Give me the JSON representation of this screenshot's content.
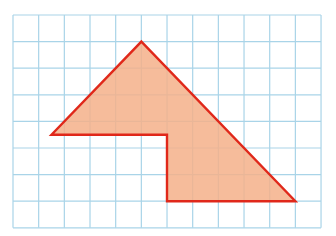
{
  "figure": {
    "type": "grid-polygon",
    "grid": {
      "columns": 12,
      "rows": 8,
      "origin_px": [
        13,
        15
      ],
      "cell_w": 25.67,
      "cell_h": 26.6,
      "line_color": "#a9d4e8"
    },
    "polygon": {
      "fill": "#f4b08a",
      "stroke": "#e0281a",
      "stroke_width": 2.4,
      "vertices_grid": [
        [
          5,
          1
        ],
        [
          11,
          7
        ],
        [
          6,
          7
        ],
        [
          6,
          4.5
        ],
        [
          1.5,
          4.5
        ]
      ]
    }
  }
}
